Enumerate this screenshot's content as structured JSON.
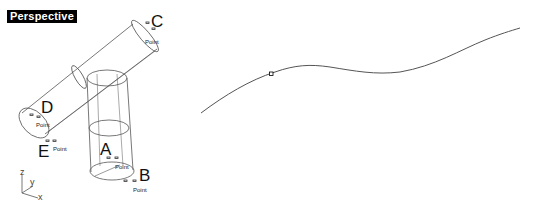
{
  "left_viewport": {
    "title": "Perspective",
    "points": [
      {
        "label": "A",
        "sub": "Point"
      },
      {
        "label": "B",
        "sub": "Point"
      },
      {
        "label": "C",
        "sub": "Point"
      },
      {
        "label": "D",
        "sub": "Point"
      },
      {
        "label": "E",
        "sub": "Point"
      }
    ],
    "axes": {
      "x": "x",
      "y": "y",
      "z": "z"
    }
  },
  "right_canvas": {
    "curve_color": "#555555",
    "marker_color": "#000000"
  },
  "colors": {
    "background": "#ffffff",
    "title_bg": "#000000",
    "title_fg": "#ffffff",
    "wire": "#555555"
  }
}
